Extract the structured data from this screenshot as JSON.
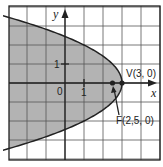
{
  "chart_data": {
    "type": "line",
    "title": "",
    "xlabel": "x",
    "ylabel": "y",
    "xlim": [
      -3,
      5
    ],
    "ylim": [
      -4,
      4
    ],
    "grid": true,
    "unit_px": 19,
    "origin_px": [
      65,
      83
    ],
    "series": [
      {
        "name": "parabola",
        "equation": "y^2 = -2(x - 3)",
        "shaded_region": "interior (left of curve)",
        "fill_color": "#b3b3b3",
        "stroke_color": "#222222"
      }
    ],
    "points": [
      {
        "name": "vertex",
        "label": "V(3, 0)",
        "x": 3,
        "y": 0
      },
      {
        "name": "focus",
        "label": "F(2,5, 0)",
        "x": 2.5,
        "y": 0
      }
    ],
    "tick_labels": {
      "origin": "0",
      "x_one": "1",
      "y_one": "1"
    }
  },
  "labels": {
    "x_axis": "x",
    "y_axis": "y",
    "origin": "0",
    "x_tick_1": "1",
    "y_tick_1": "1",
    "vertex": "V(3, 0)",
    "focus": "F(2,5, 0)"
  }
}
